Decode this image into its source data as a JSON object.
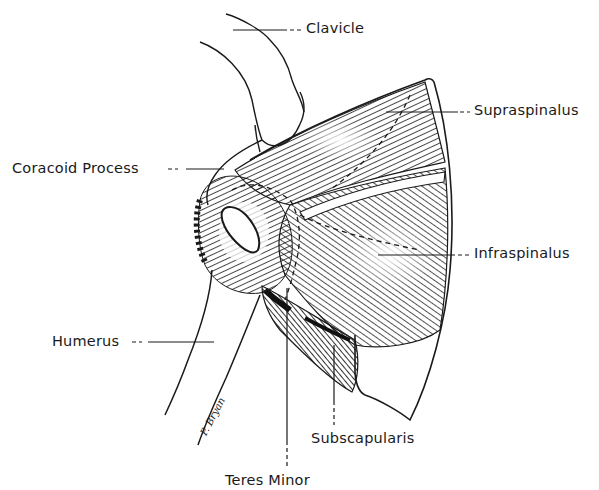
{
  "figure": {
    "type": "anatomical line drawing",
    "signature": "P. Bryan"
  },
  "labels": {
    "clavicle": "Clavicle",
    "supraspinatus": "Supraspinalus",
    "coracoid_process": "Coracoid Process",
    "infraspinatus": "Infraspinalus",
    "humerus": "Humerus",
    "subscapularis": "Subscapularis",
    "teres_minor": "Teres Minor"
  },
  "colors": {
    "ink": "#1a1a1a",
    "background": "#ffffff"
  }
}
